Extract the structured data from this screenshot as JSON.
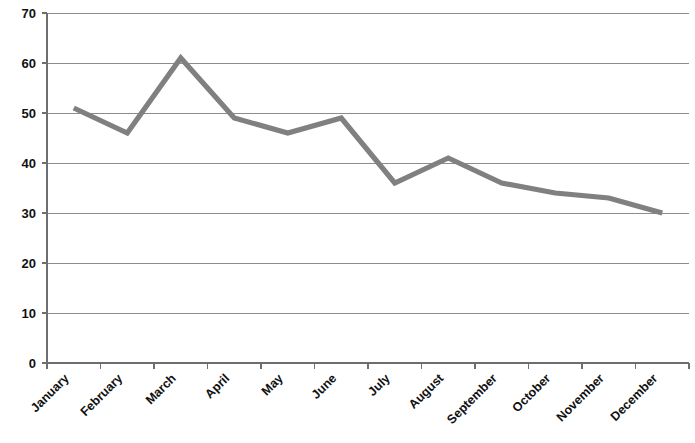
{
  "chart_data": {
    "type": "line",
    "title": "",
    "subtitle": "",
    "xlabel": "",
    "ylabel": "",
    "categories": [
      "January",
      "February",
      "March",
      "April",
      "May",
      "June",
      "July",
      "August",
      "September",
      "October",
      "November",
      "December"
    ],
    "values": [
      51,
      46,
      61,
      49,
      46,
      49,
      36,
      41,
      36,
      34,
      33,
      30
    ],
    "series": [
      {
        "name": "",
        "values": [
          51,
          46,
          61,
          49,
          46,
          49,
          36,
          41,
          36,
          34,
          33,
          30
        ]
      }
    ],
    "ylim": [
      0,
      70
    ],
    "yticks": [
      0,
      10,
      20,
      30,
      40,
      50,
      60,
      70
    ],
    "ytick_labels": [
      "0",
      "10",
      "20",
      "30",
      "40",
      "50",
      "60",
      "70"
    ],
    "grid": true,
    "grid_axis": "y",
    "legend": false,
    "legend_position": "none",
    "line_color": "#808080",
    "grid_color": "#8c8c8c",
    "axis_color": "#6e6e6e",
    "background_color": "#ffffff",
    "xtick_rotation": 45,
    "annotations": []
  }
}
